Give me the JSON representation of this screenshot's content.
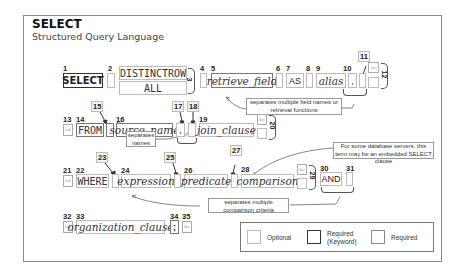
{
  "header": {
    "title": "SELECT",
    "subtitle": "Structured Query Language"
  },
  "row1": {
    "n1": "1",
    "select_kw": "SELECT",
    "n2": "2",
    "distinctrow": "DISTINCTROW",
    "all": "ALL",
    "n3": "3",
    "n4": "4",
    "n5": "5",
    "retrieve_field": "retrieve_field",
    "n6": "6",
    "n7": "7",
    "as_kw": "AS",
    "n8": "8",
    "n9": "9",
    "alias": "alias",
    "n10": "10",
    "comma": ",",
    "n11": "11",
    "n12": "12",
    "note": "separates multiple field names or retrieval functions"
  },
  "row2": {
    "n13": "13",
    "n14": "14",
    "from_kw": "FROM",
    "n15": "15",
    "n16": "16",
    "source_name": "source_name",
    "n17": "17",
    "comma": ",",
    "n18": "18",
    "n19": "19",
    "join_clause": "join_clause",
    "n20": "20",
    "note": "separates names",
    "info": "For some database servers, this term may be an embedded SELECT clause"
  },
  "row3": {
    "n21": "21",
    "n22": "22",
    "where_kw": "WHERE",
    "n23": "23",
    "n24": "24",
    "expression": "expression",
    "n25": "25",
    "n26": "26",
    "predicate": "predicate",
    "n27": "27",
    "n28": "28",
    "comparison": "comparison",
    "n29": "29",
    "n30": "30",
    "and_kw": "AND",
    "n31": "31",
    "note": "separates multiple comparison criteria"
  },
  "row4": {
    "n32": "32",
    "n33": "33",
    "organization_clause": "organization_clause",
    "n34": "34",
    "semicolon": ";",
    "n35": "35"
  },
  "legend": {
    "optional": "Optional",
    "required_keyword_1": "Required",
    "required_keyword_2": "(Keyword)",
    "required": "Required"
  },
  "icons": {
    "continue_in": "⇨",
    "continue_out": "⇦"
  }
}
